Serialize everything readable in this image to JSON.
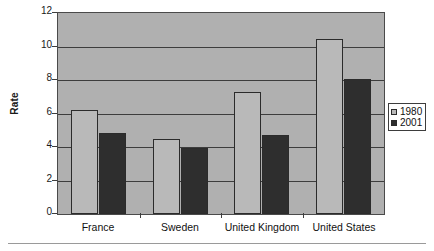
{
  "chart_data": {
    "type": "bar",
    "title": "",
    "xlabel": "",
    "ylabel": "Rate",
    "categories": [
      "France",
      "Sweden",
      "United Kingdom",
      "United States"
    ],
    "series": [
      {
        "name": "1980",
        "color": "#b9b9b9",
        "values": [
          6.2,
          4.45,
          7.3,
          10.45
        ]
      },
      {
        "name": "2001",
        "color": "#2e2e2e",
        "values": [
          4.85,
          3.95,
          4.7,
          8.05
        ]
      }
    ],
    "ylim": [
      0,
      12
    ],
    "yticks": [
      0,
      2,
      4,
      6,
      8,
      10,
      12
    ],
    "ytick_labels": [
      "0",
      "2",
      "4",
      "6",
      "8",
      "10",
      "12"
    ],
    "grid": true,
    "legend_position": "right",
    "plot_background": "#b0b0b0",
    "axis_color": "#3d3d3d"
  },
  "legend": {
    "entries": [
      {
        "label": "1980"
      },
      {
        "label": "2001"
      }
    ]
  }
}
